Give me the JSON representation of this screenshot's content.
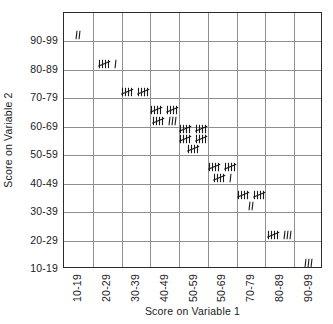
{
  "chart_data": {
    "type": "heatmap",
    "title": "",
    "xlabel": "Score on Variable 1",
    "ylabel": "Score on Variable 2",
    "grid": true,
    "legend": "none",
    "notation": "tally-marks",
    "categories": [
      "10-19",
      "20-29",
      "30-39",
      "40-49",
      "50-59",
      "50-69",
      "70-79",
      "80-89",
      "90-99"
    ],
    "y_categories": [
      "90-99",
      "80-89",
      "70-79",
      "60-69",
      "50-59",
      "40-49",
      "30-39",
      "20-29",
      "10-19"
    ],
    "cells": [
      {
        "x": "10-19",
        "y": "90-99",
        "count": 2,
        "tally_text": "II",
        "lines": [
          [
            0,
            2
          ]
        ]
      },
      {
        "x": "20-29",
        "y": "80-89",
        "count": 6,
        "tally_text": "HHT I",
        "lines": [
          [
            1,
            1
          ]
        ]
      },
      {
        "x": "30-39",
        "y": "70-79",
        "count": 10,
        "tally_text": "HHT HHT",
        "lines": [
          [
            2,
            0
          ]
        ]
      },
      {
        "x": "40-49",
        "y": "60-69",
        "count": 18,
        "tally_text": "HHT HHT / HHT III",
        "lines": [
          [
            2,
            0
          ],
          [
            1,
            3
          ]
        ]
      },
      {
        "x": "50-59",
        "y": "50-59",
        "count": 25,
        "tally_text": "HHT HHT / HHT HHT / HHT",
        "lines": [
          [
            2,
            0
          ],
          [
            2,
            0
          ],
          [
            1,
            0
          ]
        ]
      },
      {
        "x": "50-69",
        "y": "40-49",
        "count": 16,
        "tally_text": "HHT HHT / HHT I",
        "lines": [
          [
            2,
            0
          ],
          [
            1,
            1
          ]
        ]
      },
      {
        "x": "70-79",
        "y": "30-39",
        "count": 12,
        "tally_text": "HHT HHT / II",
        "lines": [
          [
            2,
            0
          ],
          [
            0,
            2
          ]
        ]
      },
      {
        "x": "80-89",
        "y": "20-29",
        "count": 8,
        "tally_text": "HHT III",
        "lines": [
          [
            1,
            3
          ]
        ]
      },
      {
        "x": "90-99",
        "y": "10-19",
        "count": 3,
        "tally_text": "III",
        "lines": [
          [
            0,
            3
          ]
        ]
      }
    ],
    "total_count": 100
  },
  "axes": {
    "x_title": "Score on Variable 1",
    "y_title": "Score on Variable 2",
    "x_ticks": [
      "10-19",
      "20-29",
      "30-39",
      "40-49",
      "50-59",
      "50-69",
      "70-79",
      "80-89",
      "90-99"
    ],
    "y_ticks": [
      "90-99",
      "80-89",
      "70-79",
      "60-69",
      "50-59",
      "40-49",
      "30-39",
      "20-29",
      "10-19"
    ]
  },
  "colors": {
    "border": "#2b2b2b",
    "gridline": "#8e8e8e",
    "text": "#1a1a1a",
    "background": "#ffffff"
  }
}
